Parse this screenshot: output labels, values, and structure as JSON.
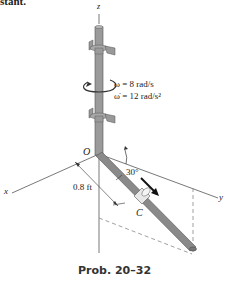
{
  "header_fragment": "stant.",
  "axes": {
    "x": "x",
    "y": "y",
    "z": "z"
  },
  "labels": {
    "origin": "O",
    "point_c": "C",
    "omega": "ω = 8 rad/s",
    "omega_dot": "ω̇ = 12 rad/s²",
    "angle": "30°",
    "distance": "0.8 ft"
  },
  "caption": "Prob. 20–32",
  "colors": {
    "rod": "#9a9a9a",
    "rod_dark": "#6e6e6e",
    "line": "#444444",
    "dashed": "#888888"
  }
}
